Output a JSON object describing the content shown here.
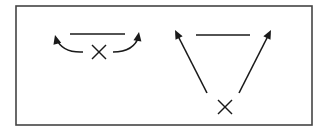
{
  "canvas": {
    "width": 327,
    "height": 131,
    "background": "#ffffff"
  },
  "colors": {
    "stroke": "#1a1a1a",
    "frame": "#444444"
  },
  "frame": {
    "x": 16,
    "y": 6,
    "width": 296,
    "height": 119,
    "stroke_width": 1.6
  },
  "panels": [
    {
      "name": "left-panel",
      "description": "Bar with X beneath; two curved arrows sweep outward and upward",
      "bar": {
        "x1": 70,
        "y1": 34,
        "x2": 125,
        "y2": 34
      },
      "cross": {
        "cx": 99,
        "cy": 52,
        "size": 7
      },
      "arrows": [
        {
          "name": "left-curved-arrow",
          "d": "M 83 52 Q 62 53 56 38",
          "tip": [
            55,
            35
          ],
          "angle": -105
        },
        {
          "name": "right-curved-arrow",
          "d": "M 113 52 Q 134 52 139 36",
          "tip": [
            139,
            32
          ],
          "angle": -80
        }
      ]
    },
    {
      "name": "right-panel",
      "description": "Bar at top; X at bottom with two straight arrows diverging up toward the bar ends",
      "bar": {
        "x1": 196,
        "y1": 35,
        "x2": 250,
        "y2": 35
      },
      "cross": {
        "cx": 225,
        "cy": 107,
        "size": 7
      },
      "arrows": [
        {
          "name": "left-diagonal-arrow",
          "d": "M 207 93 L 177 34",
          "tip": [
            175,
            30
          ],
          "angle": -117
        },
        {
          "name": "right-diagonal-arrow",
          "d": "M 239 93 L 269 34",
          "tip": [
            271,
            30
          ],
          "angle": -63
        }
      ]
    }
  ]
}
